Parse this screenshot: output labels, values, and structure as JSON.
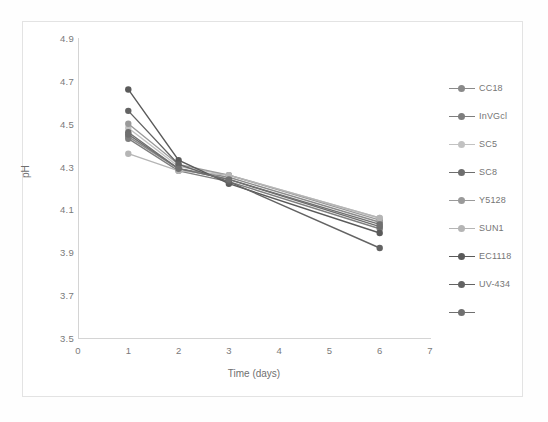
{
  "chart_data": {
    "type": "line",
    "title": "",
    "xlabel": "Time (days)",
    "ylabel": "pH",
    "x": [
      1,
      2,
      3,
      6
    ],
    "xticks": [
      "0",
      "1",
      "2",
      "3",
      "4",
      "5",
      "6",
      "7"
    ],
    "xlim": [
      0,
      7
    ],
    "yticks": [
      "3.5",
      "3.7",
      "3.9",
      "4.1",
      "4.3",
      "4.5",
      "4.7",
      "4.9"
    ],
    "ylim": [
      3.5,
      4.9
    ],
    "grid": false,
    "legend_position": "right",
    "markers": "filled-circle",
    "series": [
      {
        "name": "CC18",
        "color": "#8a8a8a",
        "values": [
          4.44,
          4.29,
          4.25,
          4.04
        ]
      },
      {
        "name": "InVGcl",
        "color": "#7e7e7e",
        "values": [
          4.43,
          4.28,
          4.23,
          4.01
        ]
      },
      {
        "name": "SC5",
        "color": "#c2c2c2",
        "values": [
          4.48,
          4.3,
          4.26,
          4.06
        ]
      },
      {
        "name": "SC8",
        "color": "#6e6e6e",
        "values": [
          4.46,
          4.29,
          4.24,
          4.02
        ]
      },
      {
        "name": "Y5128",
        "color": "#9a9a9a",
        "values": [
          4.5,
          4.31,
          4.26,
          4.05
        ]
      },
      {
        "name": "SUN1",
        "color": "#b5b5b5",
        "values": [
          4.36,
          4.28,
          4.26,
          4.06
        ]
      },
      {
        "name": "EC1118",
        "color": "#5a5a5a",
        "values": [
          4.66,
          4.33,
          4.22,
          3.99
        ]
      },
      {
        "name": "UV-434",
        "color": "#636363",
        "values": [
          4.56,
          4.31,
          4.23,
          3.92
        ]
      },
      {
        "name": "",
        "color": "#707070",
        "values": [
          4.45,
          4.29,
          4.24,
          4.03
        ]
      }
    ]
  }
}
